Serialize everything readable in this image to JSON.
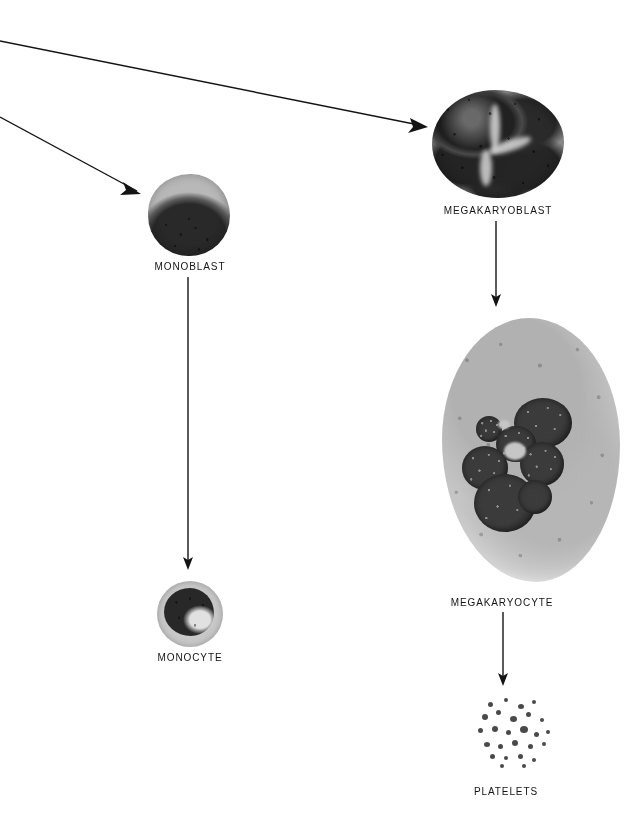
{
  "diagram": {
    "background_color": "#ffffff",
    "ink_color": "#141414",
    "width": 639,
    "height": 813
  },
  "cells": [
    {
      "id": "megakaryoblast",
      "label": "MEGAKARYOBLAST",
      "label_x": 498,
      "label_y": 205,
      "description": "Large cell with dark multilobed nucleus filling the cell"
    },
    {
      "id": "monoblast",
      "label": "MONOBLAST",
      "label_x": 190,
      "label_y": 261,
      "description": "Round cell with pale grey cytoplasm rim and large dark nucleus"
    },
    {
      "id": "megakaryocyte",
      "label": "MEGAKARYOCYTE",
      "label_x": 502,
      "label_y": 597,
      "description": "Very large cell with abundant granular pale cytoplasm and dark lobulated nucleus"
    },
    {
      "id": "monocyte",
      "label": "MONOCYTE",
      "label_x": 190,
      "label_y": 652,
      "description": "Round cell with pale cytoplasm and kidney-shaped dark nucleus"
    },
    {
      "id": "platelets",
      "label": "PLATELETS",
      "label_x": 506,
      "label_y": 786,
      "description": "Cluster of small dark granular fragments"
    }
  ],
  "arrows": [
    {
      "id": "arrow-to-megakaryoblast",
      "from": "off-page-left-upper",
      "to": "megakaryoblast",
      "x1": 0,
      "y1": 41,
      "x2": 428,
      "y2": 127
    },
    {
      "id": "arrow-to-monoblast",
      "from": "off-page-left-lower",
      "to": "monoblast",
      "x1": 0,
      "y1": 117,
      "x2": 141,
      "y2": 194
    },
    {
      "id": "arrow-megakaryoblast-to-megakaryocyte",
      "from": "megakaryoblast",
      "to": "megakaryocyte",
      "x1": 496,
      "y1": 221,
      "x2": 496,
      "y2": 307
    },
    {
      "id": "arrow-monoblast-to-monocyte",
      "from": "monoblast",
      "to": "monocyte",
      "x1": 188,
      "y1": 277,
      "x2": 188,
      "y2": 570
    },
    {
      "id": "arrow-megakaryocyte-to-platelets",
      "from": "megakaryocyte",
      "to": "platelets",
      "x1": 503,
      "y1": 612,
      "x2": 503,
      "y2": 686
    }
  ]
}
